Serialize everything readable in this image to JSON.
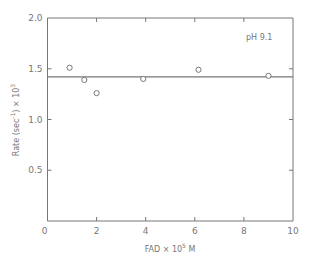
{
  "chart_data": {
    "type": "scatter",
    "title": "",
    "xlabel": "FAD × 10",
    "xlabel_sup": "5",
    "xlabel_suffix": " M",
    "ylabel": "Rate (sec",
    "ylabel_sup1": "-1",
    "ylabel_mid": ") × 10",
    "ylabel_sup2": "3",
    "xlim": [
      0,
      10
    ],
    "ylim": [
      0,
      2.0
    ],
    "x_ticks": [
      0,
      2,
      4,
      6,
      8,
      10
    ],
    "x_tick_labels": [
      "0",
      "2",
      "4",
      "6",
      "8",
      "10"
    ],
    "y_ticks": [
      0.5,
      1.0,
      1.5,
      2.0
    ],
    "y_tick_labels": [
      "0.5",
      "1.0",
      "1.5",
      "2.0"
    ],
    "grid": false,
    "annotation": "pH 9.1",
    "series": [
      {
        "name": "data",
        "marker": "open-circle",
        "x": [
          0.9,
          1.5,
          2.0,
          3.9,
          6.15,
          9.0
        ],
        "y": [
          1.51,
          1.39,
          1.26,
          1.4,
          1.49,
          1.43
        ]
      }
    ],
    "fit_line": {
      "y": 1.42,
      "x_range": [
        0,
        10
      ]
    },
    "colors": {
      "ink": "#777777",
      "background": "#ffffff"
    }
  }
}
